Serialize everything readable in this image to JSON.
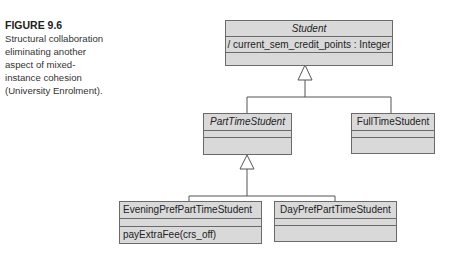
{
  "caption": {
    "figure_label": "FIGURE 9.6",
    "text": "Structural collaboration eliminating another aspect of mixed-instance cohesion (University Enrolment)."
  },
  "diagram": {
    "classes": [
      {
        "name": "Student",
        "abstract": true,
        "attributes": [
          "/ current_sem_credit_points : Integer"
        ],
        "operations": []
      },
      {
        "name": "PartTimeStudent",
        "abstract": true,
        "attributes": [],
        "operations": []
      },
      {
        "name": "FullTimeStudent",
        "abstract": false,
        "attributes": [],
        "operations": []
      },
      {
        "name": "EveningPrefPartTimeStudent",
        "abstract": false,
        "attributes": [],
        "operations": [
          "payExtraFee(crs_off)"
        ]
      },
      {
        "name": "DayPrefPartTimeStudent",
        "abstract": false,
        "attributes": [],
        "operations": []
      }
    ],
    "generalizations": [
      {
        "parent": "Student",
        "children": [
          "PartTimeStudent",
          "FullTimeStudent"
        ]
      },
      {
        "parent": "PartTimeStudent",
        "children": [
          "EveningPrefPartTimeStudent",
          "DayPrefPartTimeStudent"
        ]
      }
    ],
    "colors": {
      "box_fill": "#d9d9d9",
      "border": "#6a6a6a",
      "line": "#555555"
    }
  }
}
